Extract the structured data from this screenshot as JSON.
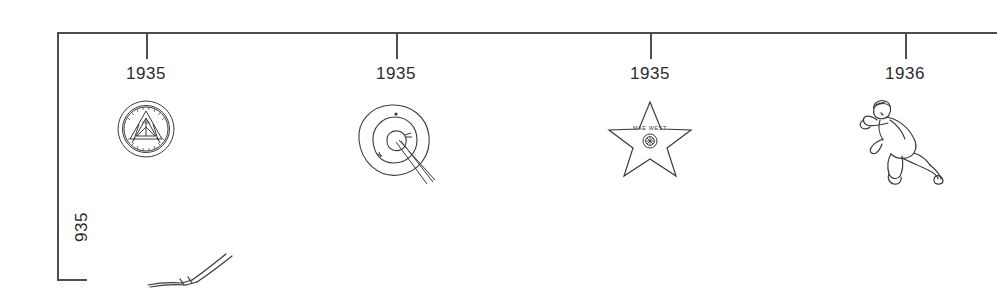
{
  "timeline": {
    "axis": {
      "orientation": "horizontal",
      "line_color": "#4d4d4d"
    },
    "events": [
      {
        "year": "1935",
        "x": 146,
        "icon_name": "institutional-seal-icon",
        "seal_ring_text": "BETHUNE COOKMAN UNIVERSITY",
        "seal_center_text": "1935"
      },
      {
        "year": "1935",
        "x": 396,
        "icon_name": "archery-target-icon",
        "description": "archery target with arrows"
      },
      {
        "year": "1935",
        "x": 650,
        "icon_name": "walk-of-fame-star-icon",
        "star_text": "MAE WEST"
      },
      {
        "year": "1936",
        "x": 905,
        "icon_name": "sprinting-runner-icon",
        "description": "runner sprinting"
      }
    ],
    "side_label": {
      "text": "935",
      "icon_name": "clipped-ski-drawing-icon"
    }
  }
}
